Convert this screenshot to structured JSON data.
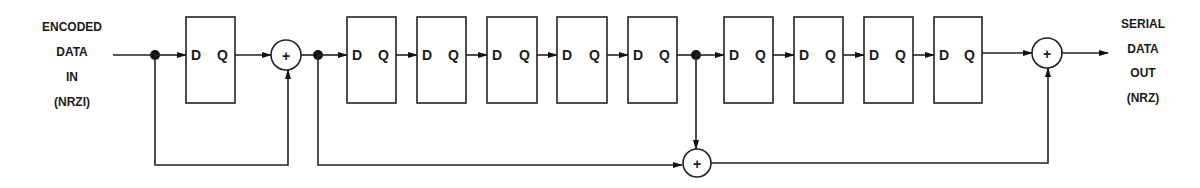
{
  "input_label": {
    "lines": [
      "ENCODED",
      "DATA",
      "IN",
      "(NRZI)"
    ]
  },
  "output_label": {
    "lines": [
      "SERIAL",
      "DATA",
      "OUT",
      "(NRZ)"
    ]
  },
  "flipflop": {
    "d_pin": "D",
    "q_pin": "Q"
  },
  "xor_symbol": "+",
  "colors": {
    "stroke": "#222222",
    "background": "#ffffff"
  },
  "stages": {
    "stage1_flipflops": 1,
    "stage2_flipflops": 5,
    "stage3_flipflops": 4,
    "xor_gates": 3,
    "junctions": 3
  }
}
